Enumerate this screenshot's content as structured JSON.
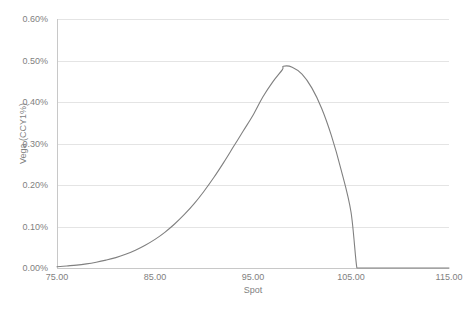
{
  "chart_data": {
    "type": "line",
    "title": "",
    "xlabel": "Spot",
    "ylabel": "Vega (CCY1%)",
    "xlim": [
      75.0,
      115.0
    ],
    "ylim": [
      0.0,
      0.006
    ],
    "grid": true,
    "legend": false,
    "y_tick_labels": [
      "0.00%",
      "0.10%",
      "0.20%",
      "0.30%",
      "0.40%",
      "0.50%",
      "0.60%"
    ],
    "y_tick_values": [
      0.0,
      0.001,
      0.002,
      0.003,
      0.004,
      0.005,
      0.006
    ],
    "x_tick_labels": [
      "75.00",
      "85.00",
      "95.00",
      "105.00",
      "115.00"
    ],
    "x_tick_values": [
      75.0,
      85.0,
      95.0,
      105.0,
      115.0
    ],
    "series": [
      {
        "name": "Vega",
        "color": "#808080",
        "x": [
          75.0,
          76.0,
          77.0,
          78.0,
          79.0,
          80.0,
          81.0,
          82.0,
          83.0,
          84.0,
          85.0,
          86.0,
          87.0,
          88.0,
          89.0,
          90.0,
          91.0,
          92.0,
          93.0,
          94.0,
          95.0,
          96.0,
          97.0,
          98.0,
          98.1,
          99.0,
          100.0,
          101.0,
          102.0,
          103.0,
          104.0,
          105.0,
          105.6,
          106.0,
          108.0,
          110.0,
          112.0,
          115.0
        ],
        "y": [
          3e-05,
          5e-05,
          7e-05,
          0.0001,
          0.00014,
          0.00019,
          0.00025,
          0.00033,
          0.00043,
          0.00055,
          0.00069,
          0.00086,
          0.00106,
          0.00129,
          0.00155,
          0.00185,
          0.00218,
          0.00254,
          0.00292,
          0.0033,
          0.00368,
          0.00412,
          0.00448,
          0.00478,
          0.00486,
          0.00484,
          0.00467,
          0.00434,
          0.00385,
          0.00319,
          0.00236,
          0.00135,
          0.0,
          0.0,
          0.0,
          0.0,
          0.0,
          0.0
        ]
      }
    ],
    "peak": {
      "x": 98.1,
      "y": 0.00486,
      "label": "0.486%"
    },
    "zero_cutoff_x": 105.6
  },
  "colors": {
    "gridline": "#e4e4e4",
    "axis": "#c8c8c8",
    "tick_text": "#7f7f7f",
    "series": "#808080",
    "background": "#ffffff"
  }
}
